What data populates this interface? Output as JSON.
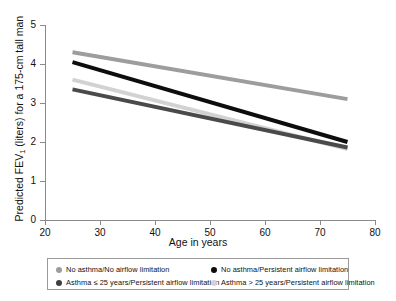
{
  "chart_data": {
    "type": "line",
    "title": "",
    "xlabel": "Age in years",
    "ylabel": "Predicted FEV₁ (liters) for a 175-cm tall man",
    "ylabel_main": "Predicted FEV",
    "ylabel_sub": "1",
    "ylabel_rest": " (liters) for a 175-cm tall man",
    "xlim": [
      20,
      80
    ],
    "ylim": [
      0,
      5
    ],
    "xticks": [
      20,
      30,
      40,
      50,
      60,
      70,
      80
    ],
    "yticks": [
      0,
      1,
      2,
      3,
      4,
      5
    ],
    "grid": false,
    "legend_position": "bottom",
    "x": [
      25,
      75
    ],
    "series": [
      {
        "name": "No asthma/No airflow limitation",
        "color": "#9d9d9d",
        "values": [
          4.3,
          3.1
        ],
        "style": "thick-line"
      },
      {
        "name": "No asthma/Persistent airflow limitation",
        "color": "#0d0d0d",
        "values": [
          4.05,
          2.0
        ],
        "style": "thick-line"
      },
      {
        "name": "Asthma > 25 years/Persistent airflow limitation",
        "color": "#d2d2d2",
        "values": [
          3.6,
          1.82
        ],
        "style": "thick-line"
      },
      {
        "name": "Asthma ≤ 25 years/Persistent airflow limitation",
        "color": "#4a4a4a",
        "values": [
          3.35,
          1.86
        ],
        "style": "thick-line"
      }
    ]
  },
  "axes": {
    "y_tick_labels": [
      "0",
      "1",
      "2",
      "3",
      "4",
      "5"
    ],
    "x_tick_labels": [
      "20",
      "30",
      "40",
      "50",
      "60",
      "70",
      "80"
    ],
    "x_title": "Age in years"
  },
  "legend": {
    "entries": [
      {
        "label": "No asthma/No airflow limitation",
        "color": "#9d9d9d",
        "row": 0,
        "col": 0
      },
      {
        "label": "No asthma/Persistent airflow limitation",
        "color": "#0d0d0d",
        "row": 0,
        "col": 1
      },
      {
        "label": "Asthma ≤ 25 years/Persistent airflow limitation",
        "color": "#3f3f3f",
        "row": 1,
        "col": 0
      },
      {
        "label": "Asthma > 25 years/Persistent airflow limitation",
        "color": "#d2d2d2",
        "row": 1,
        "col": 1
      }
    ]
  }
}
